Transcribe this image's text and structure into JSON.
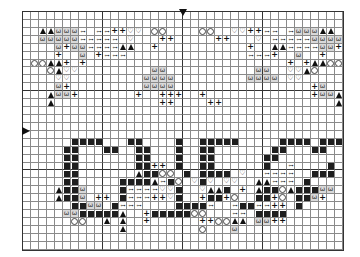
{
  "chart_data": {
    "type": "table",
    "title": "",
    "cols": 40,
    "rows": 30,
    "center_markers": {
      "top_col": 20,
      "left_row": 15
    },
    "legend": {
      ".": "empty",
      "#": "filled-square",
      "^": "triangle",
      "w": "omega",
      "o": "circle",
      "h": "heart",
      "+": "plus",
      "x": "oval-pair"
    },
    "glyphs": {
      "w": "ω",
      "h": "♡",
      "+": "+",
      "x": "⊶"
    },
    "grid": [
      "........................................",
      "........................................",
      "..^^wwwx.xx++hh.oo....oo..hh++xx.xwww^^.",
      "..wwwwwxxxxx.h...++.....++...h.xxxxxwwww",
      "....w+wwxxxx^^..+...........+..^^xxxxww+w",
      "....+..w.+xxx...............xxx+..w..+..",
      ".oo^^+.+.........................+.+^^oo",
      "...o^hh.........ww...........ww..hh^o...",
      "....hh.........wwww.........wwww.hh.....",
      "....w+.........wwww.................+w..",
      "...^ww+.......+..+++..+.............+ww^",
      "...^.............++....++..............^",
      "........................................",
      "........................................",
      "........................................",
      "........................................",
      "......####...##....#..#####.....####.###",
      ".....##...##..##...#..##.......##...##..",
      ".....##.......##...#..##......##........",
      ".....##.......##++.#..##......#..x....#.",
      ".....##.......^##oo.#.####.h..xxxx..###.",
      ".....##.....####^x#o.h#h.hh..^^xxx.#....",
      "....^##w....#xxxxhh#..h^^#.+.^##o^###ww.",
      "....^##w.++.#xxx++h#..+##+o..##+o.##w+..",
      "......##ww.#xxx....####x..x##xx++.#.....",
      ".....ww#####^..+#####oo...xx.####.......",
      "......oo..^.^..+......++oo^^.ww++........",
      "............^.........o...w.............",
      "........................................",
      "........................................"
    ]
  }
}
